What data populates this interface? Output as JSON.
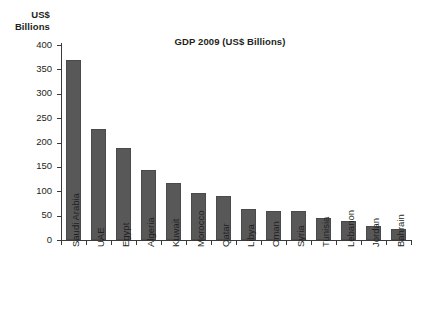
{
  "chart_data": {
    "type": "bar",
    "title": "GDP 2009 (US$ Billions)",
    "xlabel": "",
    "ylabel": "US$ Billions",
    "ylabel_line1": "US$",
    "ylabel_line2": "Billions",
    "categories": [
      "Saudi Arabia",
      "UAE",
      "Egypt",
      "Algeria",
      "Kuwait",
      "Morocco",
      "Qatar",
      "Libya",
      "Oman",
      "Syria",
      "Tunisia",
      "Lebanon",
      "Jordan",
      "Bahrain"
    ],
    "values": [
      369,
      228,
      189,
      143,
      116,
      96,
      90,
      63,
      60,
      60,
      45,
      38,
      28,
      22
    ],
    "ylim": [
      0,
      400
    ],
    "yticks": [
      0,
      50,
      100,
      150,
      200,
      250,
      300,
      350,
      400
    ],
    "ytick_labels": [
      "0",
      "50",
      "100",
      "150",
      "200",
      "250",
      "300",
      "350",
      "400"
    ],
    "grid": false,
    "legend": null,
    "bar_color": "#585859",
    "axis_color": "#3a3a3a",
    "background": "#ffffff"
  }
}
